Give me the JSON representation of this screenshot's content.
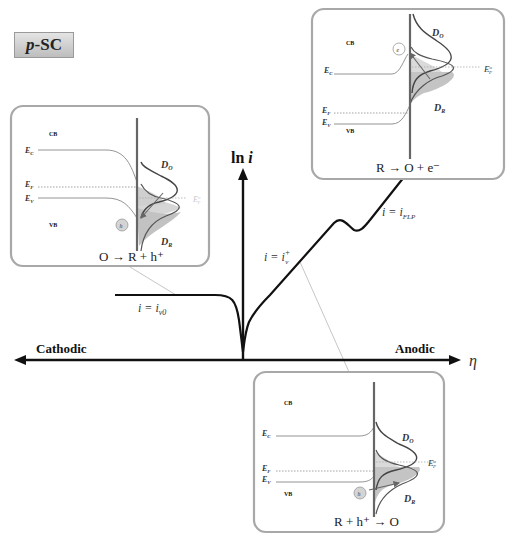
{
  "badge": {
    "prefix": "p",
    "suffix": "-SC"
  },
  "axes": {
    "y_label": "ln i",
    "x_label": "η",
    "left_label": "Cathodic",
    "right_label": "Anodic"
  },
  "curve_labels": {
    "plateau": "i = i_v0",
    "rise": "i = i_v^+",
    "flp": "i = i_FLP"
  },
  "panels": {
    "left": {
      "cb": "CB",
      "vb": "VB",
      "ec": "E_C",
      "ef": "E_F",
      "ev": "E_V",
      "do": "D_O",
      "dr": "D_R",
      "eredox": "E_F°",
      "carrier": "h",
      "reaction": "O → R + h⁺"
    },
    "top_right": {
      "cb": "CB",
      "vb": "VB",
      "ec": "E_C",
      "ef": "E_F",
      "ev": "E_V",
      "do": "D_O",
      "dr": "D_R",
      "eredox": "E_F°",
      "carrier": "e",
      "reaction": "R → O + e⁻"
    },
    "bottom": {
      "cb": "CB",
      "vb": "VB",
      "ec": "E_C",
      "ef": "E_F",
      "ev": "E_V",
      "do": "D_O",
      "dr": "D_R",
      "eredox": "E_F°",
      "carrier": "h",
      "reaction": "R + h⁺ → O"
    }
  },
  "colors": {
    "panel_border": "#a8a8a8",
    "curve": "#111111",
    "band_line": "#777777",
    "dos_fill": "#c8c8c8",
    "connector": "#b0b0b0"
  }
}
